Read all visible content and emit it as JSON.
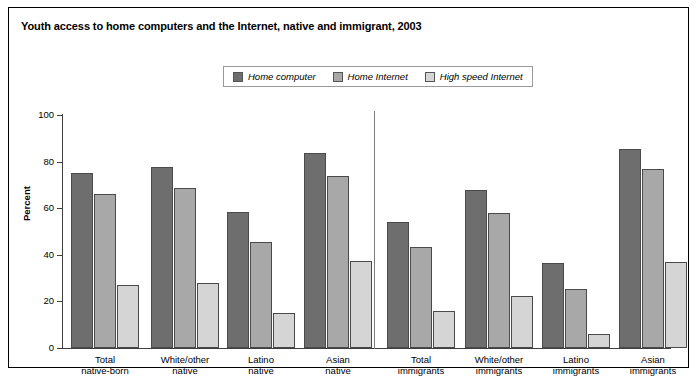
{
  "title": "Youth access to home computers and the Internet, native and immigrant, 2003",
  "legend": {
    "position": "top-center",
    "items": [
      {
        "label": "Home computer",
        "color": "#6e6e6e"
      },
      {
        "label": "Home Internet",
        "color": "#a8a8a8"
      },
      {
        "label": "High speed Internet",
        "color": "#d5d5d5"
      }
    ]
  },
  "axes": {
    "ylabel": "Percent",
    "yticks": [
      "0",
      "20",
      "40",
      "60",
      "80",
      "100"
    ],
    "ymin": 0,
    "ymax": 100
  },
  "chart_data": {
    "type": "bar",
    "title": "Youth access to home computers and the Internet, native and immigrant, 2003",
    "xlabel": "",
    "ylabel": "Percent",
    "ylim": [
      0,
      100
    ],
    "grid": false,
    "legend_position": "top-center",
    "categories": [
      "Total native-born",
      "White/other native",
      "Latino native",
      "Asian native",
      "Total immigrants",
      "White/other immigrants",
      "Latino immigrants",
      "Asian immigrants"
    ],
    "category_lines": [
      [
        "Total",
        "native-born"
      ],
      [
        "White/other",
        "native"
      ],
      [
        "Latino",
        "native"
      ],
      [
        "Asian",
        "native"
      ],
      [
        "Total",
        "immigrants"
      ],
      [
        "White/other",
        "immigrants"
      ],
      [
        "Latino",
        "immigrants"
      ],
      [
        "Asian",
        "immigrants"
      ]
    ],
    "series": [
      {
        "name": "Home computer",
        "color": "#6e6e6e",
        "values": [
          75,
          77.5,
          58.5,
          83.5,
          54,
          68,
          36.5,
          85.5
        ]
      },
      {
        "name": "Home Internet",
        "color": "#a8a8a8",
        "values": [
          66,
          68.5,
          45.5,
          74,
          43.5,
          58,
          25.5,
          77
        ]
      },
      {
        "name": "High speed Internet",
        "color": "#d5d5d5",
        "values": [
          27,
          28,
          15,
          37.5,
          16,
          22.5,
          6,
          37
        ]
      }
    ],
    "annotations": [
      {
        "type": "vertical-divider",
        "label": "native / immigrant separator",
        "after_category": "Asian native"
      }
    ]
  }
}
